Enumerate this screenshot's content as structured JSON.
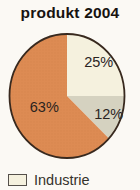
{
  "chart_data": {
    "type": "pie",
    "title": "produkt 2004",
    "unit": "%",
    "values": [
      25,
      12,
      63
    ],
    "data_labels": [
      "25%",
      "12%",
      "63%"
    ],
    "slice_colors": [
      "#f5f1de",
      "#d5d2c0",
      "#dd8b53"
    ],
    "outline_color": "#38291e",
    "start_angle": "12 o'clock, clockwise",
    "legend_position": "bottom-left",
    "legend_entries": [
      {
        "label": "Industrie",
        "color": "#f5f1de"
      }
    ]
  }
}
